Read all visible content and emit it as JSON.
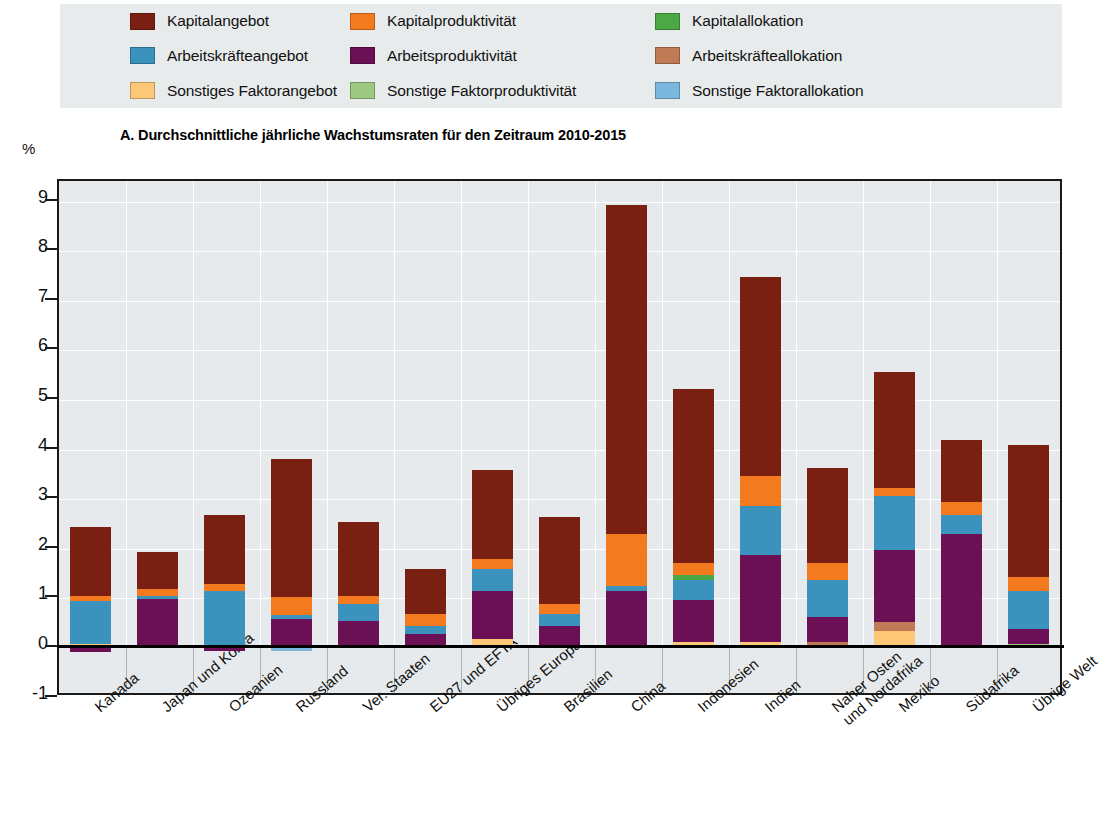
{
  "axis": {
    "unit_label": "%",
    "ylabel": "",
    "yticks": [
      9,
      8,
      7,
      6,
      5,
      4,
      3,
      2,
      1,
      0,
      -1
    ],
    "ylim": [
      -1,
      9.6
    ]
  },
  "title": "A. Durchschnittliche jährliche Wachstumsraten für den Zeitraum 2010-2015",
  "legend": {
    "items": [
      {
        "label": "Kapitalangebot",
        "color": "#7a2012",
        "col": 1,
        "row": 1
      },
      {
        "label": "Kapitalproduktivität",
        "color": "#f47a20",
        "col": 2,
        "row": 1
      },
      {
        "label": "Kapitalallokation",
        "color": "#4ca845",
        "col": 3,
        "row": 1
      },
      {
        "label": "Arbeitskräfteangebot",
        "color": "#3a92bd",
        "col": 1,
        "row": 2
      },
      {
        "label": "Arbeitsproduktivität",
        "color": "#6b1054",
        "col": 2,
        "row": 2
      },
      {
        "label": "Arbeitskräfteallokation",
        "color": "#c07a56",
        "col": 3,
        "row": 2
      },
      {
        "label": "Sonstiges Faktorangebot",
        "color": "#fcc877",
        "col": 1,
        "row": 3
      },
      {
        "label": "Sonstige Faktorproduktivität",
        "color": "#9cc882",
        "col": 2,
        "row": 3
      },
      {
        "label": "Sonstige Faktorallokation",
        "color": "#7cb8dd",
        "col": 3,
        "row": 3
      }
    ]
  },
  "chart_data": {
    "type": "bar",
    "stacked": true,
    "title": "A. Durchschnittliche jährliche Wachstumsraten für den Zeitraum 2010-2015",
    "xlabel": "",
    "ylabel": "%",
    "ylim": [
      -1,
      9.6
    ],
    "yticks": [
      -1,
      0,
      1,
      2,
      3,
      4,
      5,
      6,
      7,
      8,
      9
    ],
    "grid": true,
    "legend_position": "top",
    "categories": [
      "Kanada",
      "Japan und Korea",
      "Ozeanien",
      "Russland",
      "Ver. Staaten",
      "EU27 und EFTA",
      "Übriges Europa",
      "Brasilien",
      "China",
      "Indonesien",
      "Indien",
      "Naher Osten\nund Nordafrika",
      "Mexiko",
      "Südafrika",
      "Übrige Welt"
    ],
    "series": [
      {
        "name": "Kapitalangebot",
        "color": "#7a2012",
        "values": [
          1.4,
          0.75,
          1.4,
          2.8,
          1.5,
          0.9,
          1.8,
          1.75,
          6.65,
          3.5,
          4.0,
          1.9,
          2.35,
          1.25,
          2.65
        ]
      },
      {
        "name": "Kapitalproduktivität",
        "color": "#f47a20",
        "values": [
          0.1,
          0.14,
          0.15,
          0.35,
          0.15,
          0.25,
          0.2,
          0.2,
          1.05,
          0.25,
          0.6,
          0.35,
          0.15,
          0.25,
          0.3
        ]
      },
      {
        "name": "Kapitalallokation",
        "color": "#4ca845",
        "values": [
          0.0,
          0.0,
          0.0,
          0.0,
          0.0,
          0.0,
          0.0,
          0.0,
          0.0,
          0.1,
          0.0,
          0.0,
          0.0,
          0.0,
          0.0
        ]
      },
      {
        "name": "Arbeitskräfteangebot",
        "color": "#3a92bd",
        "values": [
          0.85,
          0.05,
          1.1,
          0.08,
          0.35,
          0.15,
          0.45,
          0.25,
          0.1,
          0.4,
          1.0,
          0.75,
          1.1,
          0.4,
          0.75
        ]
      },
      {
        "name": "Arbeitsproduktivität",
        "color": "#6b1054",
        "values": [
          -0.12,
          0.95,
          -0.1,
          0.55,
          0.5,
          0.25,
          0.95,
          0.4,
          1.1,
          0.85,
          1.75,
          0.5,
          1.45,
          2.25,
          0.3
        ]
      },
      {
        "name": "Arbeitskräfteallokation",
        "color": "#c07a56",
        "values": [
          0.0,
          0.0,
          0.0,
          0.0,
          0.0,
          0.0,
          0.0,
          0.0,
          0.0,
          0.0,
          0.0,
          0.08,
          0.18,
          0.0,
          0.0
        ]
      },
      {
        "name": "Sonstiges Faktorangebot",
        "color": "#fcc877",
        "values": [
          0.05,
          0.0,
          0.0,
          0.0,
          0.0,
          0.0,
          0.15,
          0.0,
          0.0,
          0.08,
          0.08,
          0.0,
          0.3,
          0.0,
          0.0
        ]
      },
      {
        "name": "Sonstige Faktorproduktivität",
        "color": "#9cc882",
        "values": [
          0.0,
          0.0,
          0.0,
          0.0,
          0.0,
          0.0,
          0.0,
          0.0,
          0.0,
          0.0,
          0.0,
          0.0,
          0.0,
          0.0,
          0.05
        ]
      },
      {
        "name": "Sonstige Faktorallokation",
        "color": "#7cb8dd",
        "values": [
          0.0,
          0.0,
          0.0,
          -0.1,
          0.0,
          0.0,
          0.0,
          0.0,
          0.0,
          0.0,
          0.0,
          0.0,
          0.0,
          0.0,
          0.0
        ]
      }
    ],
    "totals": [
      2.4,
      2.13,
      2.65,
      3.65,
      2.17,
      1.55,
      3.55,
      3.3,
      8.85,
      5.25,
      7.4,
      3.5,
      5.3,
      4.15,
      4.03
    ],
    "stack_order": [
      "Sonstiges Faktorangebot",
      "Sonstige Faktorproduktivität",
      "Sonstige Faktorallokation",
      "Arbeitskräfteallokation",
      "Arbeitsproduktivität",
      "Arbeitskräfteangebot",
      "Kapitalallokation",
      "Kapitalproduktivität",
      "Kapitalangebot"
    ]
  }
}
